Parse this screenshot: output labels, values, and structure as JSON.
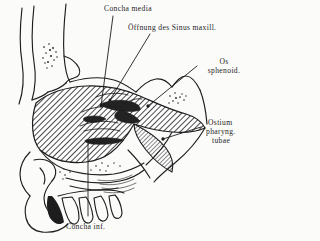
{
  "figure": {
    "type": "anatomical-illustration",
    "style": {
      "background": "#fbfbfa",
      "ink": "#1d1d1d",
      "hatch_color": "#4a4a4a",
      "shadow_fill": "#2b2b2b"
    }
  },
  "labels": {
    "concha_media": "Concha media",
    "oeffnung_sinus": "Öffnung des Sinus maxill.",
    "os_sphenoid_l1": "Os",
    "os_sphenoid_l2": "sphenoid.",
    "ostium_l1": "Ostium",
    "ostium_l2": "pharyng.",
    "ostium_l3": "tubae",
    "concha_inf": "Concha inf."
  }
}
